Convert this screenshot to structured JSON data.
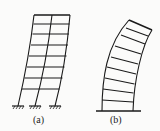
{
  "figures": [
    {
      "id": "a",
      "label": "(a)",
      "description": "Multi-storey frame with fixed supports, shear-type deformation",
      "stories": 8,
      "bays": 2,
      "supports": "fixed"
    },
    {
      "id": "b",
      "label": "(b)",
      "description": "Wall/cantilever structure, flexural-type deformation",
      "stories": 8,
      "bays": 1,
      "supports": "fixed base line"
    }
  ],
  "colors": {
    "line": "#1a1a1a",
    "background": "#fbfbfa"
  }
}
